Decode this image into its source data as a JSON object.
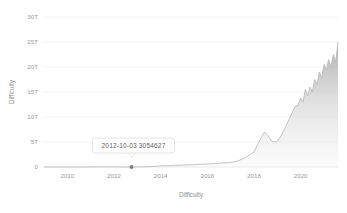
{
  "chart": {
    "type": "area",
    "title": "",
    "xlabel": "Difficulty",
    "ylabel": "Difficulty",
    "yticks": [
      "0",
      "5T",
      "10T",
      "15T",
      "20T",
      "25T",
      "30T"
    ],
    "ytick_values": [
      0,
      5,
      10,
      15,
      20,
      25,
      30
    ],
    "xticks": [
      "2010",
      "2012",
      "2014",
      "2016",
      "2018",
      "2020"
    ],
    "xtick_values": [
      2010,
      2012,
      2014,
      2016,
      2018,
      2020
    ],
    "ylim": [
      0,
      30
    ],
    "xlim": [
      2009.0,
      2021.6
    ],
    "grid": "horizontal",
    "legend": "none",
    "line_color": "#b6b6b6",
    "fill_color": "#c9c9c9",
    "grid_color": "#f1f1f1",
    "text_color": "#9a9a9a"
  },
  "tooltip": {
    "date": "2012-10-03",
    "value": "3054627",
    "label": "2012-10-03  3054627",
    "point_x": 2012.75,
    "point_y": 0.003
  },
  "chart_data": {
    "type": "area",
    "title": "",
    "xlabel": "Difficulty",
    "ylabel": "Difficulty",
    "ylim": [
      0,
      30
    ],
    "xlim": [
      2009.0,
      2021.6
    ],
    "grid": true,
    "legend": "none",
    "unit": "T (trillions)",
    "series": [
      {
        "name": "Difficulty",
        "x": [
          2009.0,
          2009.5,
          2010.0,
          2010.5,
          2011.0,
          2011.5,
          2012.0,
          2012.5,
          2012.75,
          2013.0,
          2013.5,
          2014.0,
          2014.5,
          2015.0,
          2015.5,
          2016.0,
          2016.3,
          2016.6,
          2017.0,
          2017.3,
          2017.6,
          2018.0,
          2018.15,
          2018.3,
          2018.45,
          2018.6,
          2018.75,
          2018.9,
          2019.0,
          2019.15,
          2019.3,
          2019.45,
          2019.6,
          2019.75,
          2019.9,
          2020.0,
          2020.1,
          2020.2,
          2020.3,
          2020.4,
          2020.5,
          2020.6,
          2020.7,
          2020.8,
          2020.9,
          2021.0,
          2021.1,
          2021.2,
          2021.3,
          2021.4,
          2021.5,
          2021.6
        ],
        "y": [
          0.0,
          0.0,
          0.0,
          0.0,
          0.01,
          0.02,
          0.02,
          0.003,
          0.003,
          0.01,
          0.06,
          0.2,
          0.3,
          0.4,
          0.5,
          0.6,
          0.7,
          0.8,
          0.9,
          1.2,
          1.8,
          3.0,
          4.5,
          5.8,
          7.0,
          6.3,
          5.2,
          5.0,
          5.1,
          6.2,
          7.5,
          9.0,
          10.5,
          12.0,
          12.5,
          13.8,
          13.0,
          15.5,
          14.2,
          16.0,
          15.0,
          17.5,
          16.5,
          19.0,
          17.8,
          20.5,
          19.5,
          21.5,
          20.0,
          22.5,
          21.0,
          25.0
        ]
      }
    ],
    "annotations": [
      {
        "type": "tooltip",
        "x": 2012.75,
        "y": 0.003,
        "text": "2012-10-03  3054627",
        "date": "2012-10-03",
        "value": 3054627
      }
    ]
  }
}
